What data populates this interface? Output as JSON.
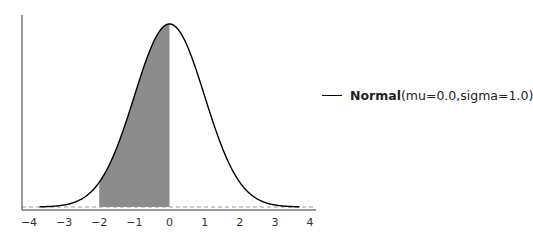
{
  "chart_data": {
    "type": "area",
    "title": "",
    "xlabel": "",
    "ylabel": "",
    "xlim": [
      -4,
      4
    ],
    "x_ticks": [
      "−4",
      "−3",
      "−2",
      "−1",
      "0",
      "1",
      "2",
      "3",
      "4"
    ],
    "x_tick_values": [
      -4,
      -3,
      -2,
      -1,
      0,
      1,
      2,
      3,
      4
    ],
    "y_ticks": [],
    "grid": false,
    "legend_position": "right",
    "series": [
      {
        "name": "Normal",
        "params": "(mu=0.0,sigma=1.0)",
        "distribution": "normal",
        "mu": 0.0,
        "sigma": 1.0,
        "x_range": [
          -3.7,
          3.7
        ],
        "color": "#000000"
      }
    ],
    "shaded_region": {
      "from": -2,
      "to": 0,
      "color": "#8c8c8c"
    },
    "baseline": {
      "y": 0,
      "style": "dashed",
      "color": "#999999"
    }
  },
  "legend": {
    "name": "Normal",
    "params": "(mu=0.0,sigma=1.0)"
  }
}
